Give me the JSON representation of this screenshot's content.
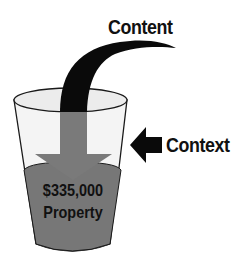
{
  "diagram": {
    "labels": {
      "content": "Content",
      "context": "Context",
      "liquid_value": "$335,000",
      "liquid_label": "Property"
    },
    "elements": {
      "content_arrow": "curved-down-arrow",
      "context_arrow": "left-arrow",
      "container": "glass"
    },
    "colors": {
      "background": "#ffffff",
      "arrow_black": "#0a0a0a",
      "liquid_gray": "#777777",
      "arrow_in_glass_gray": "#7a7a7a",
      "glass_fill": "#f4f4f4",
      "glass_outline": "#1a1a1a",
      "text": "#111111"
    }
  }
}
